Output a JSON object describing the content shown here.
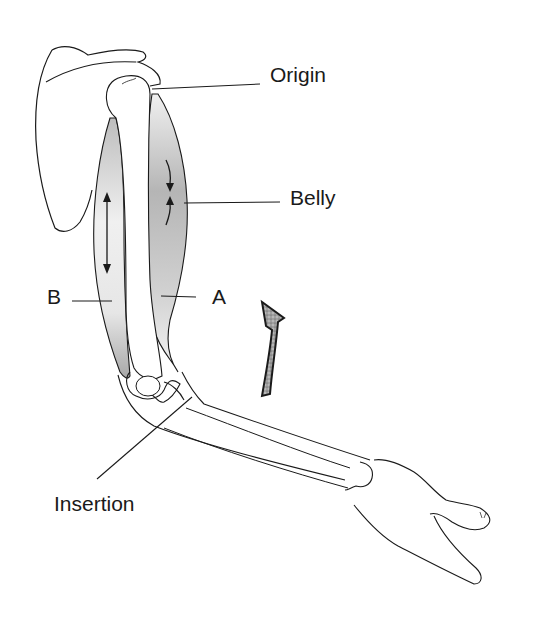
{
  "diagram": {
    "labels": {
      "origin": "Origin",
      "belly": "Belly",
      "a": "A",
      "b": "B",
      "insertion": "Insertion"
    },
    "colors": {
      "outline": "#1a1a1a",
      "muscle_shade": "#b8b8b8",
      "muscle_light": "#f2f2f2",
      "arrow_fill": "#9a9a9a",
      "background": "#ffffff"
    },
    "icons": {
      "flexion_arrow": "curved-up-arrow-icon",
      "contraction_arrows": "converging-arrows-icon",
      "stretch_arrow": "double-headed-arrow-icon"
    }
  }
}
